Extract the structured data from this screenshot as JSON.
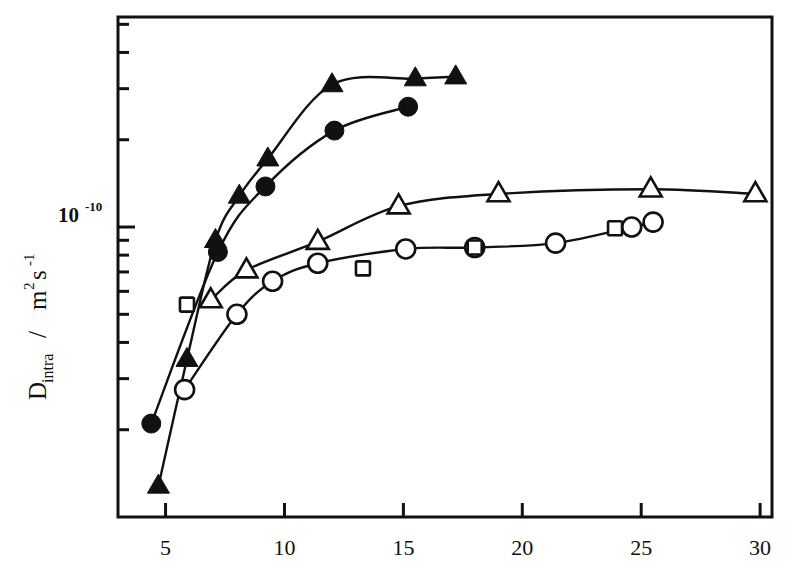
{
  "figure": {
    "background_color": "#ffffff",
    "ink_color": "#111111"
  },
  "axes": {
    "y_label_parts": {
      "symbol": "D",
      "subscript": "intra",
      "separator": " / ",
      "unit_m": "m",
      "unit_m_exp": "2",
      "unit_s": "s",
      "unit_s_exp": "-1"
    },
    "y_tick_label": {
      "mantissa": "10",
      "exponent": "-10"
    },
    "x_tick_labels": [
      "5",
      "10",
      "15",
      "20",
      "25",
      "30"
    ],
    "x_label": ""
  },
  "chart_data": {
    "type": "scatter",
    "title": "",
    "xlabel": "",
    "ylabel": "D_intra / m2 s-1",
    "xlim": [
      3.0,
      30.5
    ],
    "ylim": [
      1e-11,
      5.3e-10
    ],
    "yscale": "log",
    "xscale": "linear",
    "grid": false,
    "legend": "none",
    "y_major_ticks": [
      1e-10
    ],
    "y_minor_ticks": [
      2e-11,
      3e-11,
      4e-11,
      5e-11,
      6e-11,
      7e-11,
      8e-11,
      9e-11,
      2e-10,
      3e-10,
      4e-10,
      5e-10
    ],
    "x_ticks": [
      5,
      10,
      15,
      20,
      25,
      30
    ],
    "series": [
      {
        "name": "filled-triangle",
        "marker": "triangle-filled",
        "line": true,
        "x": [
          4.7,
          5.9,
          7.1,
          8.1,
          9.3,
          12.0,
          15.5,
          17.2
        ],
        "y": [
          1.28e-11,
          3.5e-11,
          9e-11,
          1.28e-10,
          1.72e-10,
          3.1e-10,
          3.25e-10,
          3.3e-10
        ]
      },
      {
        "name": "filled-circle",
        "marker": "circle-filled",
        "line": true,
        "x": [
          4.4,
          7.2,
          9.2,
          12.1,
          15.2
        ],
        "y": [
          2.1e-11,
          8.2e-11,
          1.38e-10,
          2.15e-10,
          2.6e-10
        ]
      },
      {
        "name": "open-triangle",
        "marker": "triangle-open",
        "line": true,
        "x": [
          6.9,
          8.4,
          11.4,
          14.8,
          19.0,
          25.4,
          29.8
        ],
        "y": [
          5.6e-11,
          7.1e-11,
          8.9e-11,
          1.18e-10,
          1.3e-10,
          1.35e-10,
          1.3e-10
        ]
      },
      {
        "name": "open-circle",
        "marker": "circle-open",
        "line": true,
        "x": [
          5.8,
          8.0,
          9.5,
          11.4,
          15.1,
          18.0,
          21.4,
          24.6,
          25.5
        ],
        "y": [
          2.75e-11,
          5e-11,
          6.5e-11,
          7.5e-11,
          8.4e-11,
          8.5e-11,
          8.8e-11,
          1e-10,
          1.04e-10
        ]
      },
      {
        "name": "open-square",
        "marker": "square-open",
        "line": false,
        "x": [
          5.9,
          13.3,
          18.0,
          23.9
        ],
        "y": [
          5.4e-11,
          7.2e-11,
          8.5e-11,
          9.9e-11
        ]
      }
    ]
  }
}
